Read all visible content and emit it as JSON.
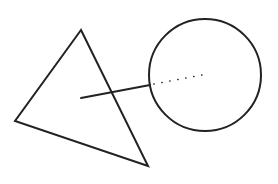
{
  "diagram": {
    "stroke_color": "#222222",
    "background": "#ffffff",
    "triangle": {
      "points": [
        [
          81,
          30
        ],
        [
          15,
          121
        ],
        [
          148,
          166
        ]
      ],
      "stroke_width": 2
    },
    "circle": {
      "cx": 205,
      "cy": 75,
      "r": 56,
      "stroke_width": 2
    },
    "solid_line": {
      "x1": 81,
      "y1": 98,
      "x2": 150,
      "y2": 85,
      "stroke_width": 2
    },
    "dotted_line": {
      "x1": 154,
      "y1": 84,
      "x2": 207,
      "y2": 74,
      "dot_spacing": 8
    }
  }
}
